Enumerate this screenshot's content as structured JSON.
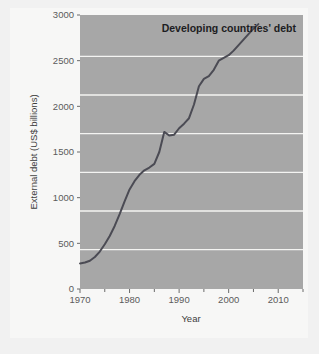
{
  "figure": {
    "title": "Developing countries' debt",
    "background_color": "#f1f1f1",
    "card_color": "#f7f7f6",
    "plot_color": "#a7a7a7",
    "grid_color": "#f4f4f2",
    "line_color": "#4b4b54",
    "tick_color": "#6a6a6a"
  },
  "chart_data": {
    "type": "line",
    "title": "Developing countries' debt",
    "xlabel": "Year",
    "ylabel": "External debt (US$ billions)",
    "xlim": [
      1970,
      2015
    ],
    "ylim": [
      0,
      3000
    ],
    "grid": true,
    "legend": "none",
    "x_ticks": [
      1970,
      1980,
      1990,
      2000,
      2010
    ],
    "x_tick_labels": [
      "1970",
      "1980",
      "1990",
      "2000",
      "2010"
    ],
    "x_minor_ticks": [
      1975,
      1985,
      1995,
      2005,
      2015
    ],
    "y_ticks": [
      0,
      500,
      1000,
      1500,
      2000,
      2500,
      3000
    ],
    "y_tick_labels": [
      "0",
      "500",
      "1000",
      "1500",
      "2000",
      "2500",
      "3000"
    ],
    "series": [
      {
        "name": "External debt (US$ billions)",
        "x": [
          1970,
          1971,
          1972,
          1973,
          1974,
          1975,
          1976,
          1977,
          1978,
          1979,
          1980,
          1981,
          1982,
          1983,
          1984,
          1985,
          1986,
          1987,
          1988,
          1989,
          1990,
          1991,
          1992,
          1993,
          1994,
          1995,
          1996,
          1997,
          1998,
          1999,
          2000,
          2001,
          2002,
          2003,
          2004,
          2005,
          2006
        ],
        "values": [
          280,
          290,
          310,
          350,
          410,
          490,
          580,
          690,
          820,
          960,
          1090,
          1180,
          1250,
          1300,
          1330,
          1370,
          1500,
          1720,
          1680,
          1690,
          1760,
          1810,
          1870,
          2020,
          2220,
          2300,
          2330,
          2400,
          2500,
          2530,
          2560,
          2610,
          2670,
          2730,
          2790,
          2850,
          2900
        ]
      }
    ]
  },
  "axes": {
    "x_title": "Year",
    "y_title": "External debt (US$ billions)"
  }
}
